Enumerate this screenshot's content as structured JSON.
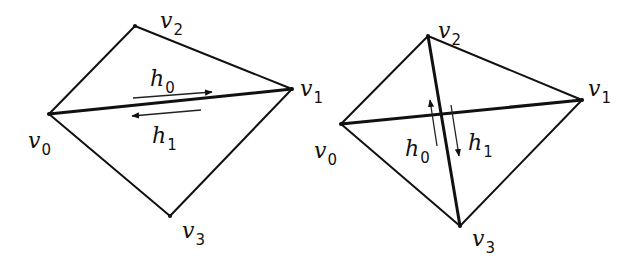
{
  "figure": {
    "colors": {
      "stroke": "#111111",
      "background": "#ffffff"
    },
    "left": {
      "name": "before-flip",
      "vertices": [
        {
          "id": "v0",
          "label": "v",
          "sub": "0",
          "x": 49,
          "y": 114,
          "lx": 28,
          "ly": 148
        },
        {
          "id": "v1",
          "label": "v",
          "sub": "1",
          "x": 292,
          "y": 89,
          "lx": 300,
          "ly": 96
        },
        {
          "id": "v2",
          "label": "v",
          "sub": "2",
          "x": 135,
          "y": 26,
          "lx": 160,
          "ly": 28
        },
        {
          "id": "v3",
          "label": "v",
          "sub": "3",
          "x": 170,
          "y": 216,
          "lx": 182,
          "ly": 238
        }
      ],
      "diagonal": [
        "v0",
        "v1"
      ],
      "half_edges": [
        {
          "id": "h0",
          "label": "h",
          "sub": "0",
          "x1": 133,
          "y1": 98,
          "x2": 212,
          "y2": 92,
          "lx": 150,
          "ly": 86
        },
        {
          "id": "h1",
          "label": "h",
          "sub": "1",
          "x1": 201,
          "y1": 110,
          "x2": 132,
          "y2": 116,
          "lx": 152,
          "ly": 143
        }
      ]
    },
    "right": {
      "name": "after-flip",
      "vertices": [
        {
          "id": "v0",
          "label": "v",
          "sub": "0",
          "x": 341,
          "y": 124,
          "lx": 314,
          "ly": 158
        },
        {
          "id": "v1",
          "label": "v",
          "sub": "1",
          "x": 582,
          "y": 100,
          "lx": 588,
          "ly": 96
        },
        {
          "id": "v2",
          "label": "v",
          "sub": "2",
          "x": 428,
          "y": 36,
          "lx": 438,
          "ly": 38
        },
        {
          "id": "v3",
          "label": "v",
          "sub": "3",
          "x": 460,
          "y": 226,
          "lx": 472,
          "ly": 246
        }
      ],
      "diagonal_v0_v1": [
        "v0",
        "v1"
      ],
      "diagonal": [
        "v2",
        "v3"
      ],
      "half_edges": [
        {
          "id": "h0",
          "label": "h",
          "sub": "0",
          "x1": 437,
          "y1": 146,
          "x2": 430,
          "y2": 100,
          "lx": 405,
          "ly": 156
        },
        {
          "id": "h1",
          "label": "h",
          "sub": "1",
          "x1": 451,
          "y1": 105,
          "x2": 459,
          "y2": 156,
          "lx": 468,
          "ly": 150
        }
      ]
    }
  }
}
